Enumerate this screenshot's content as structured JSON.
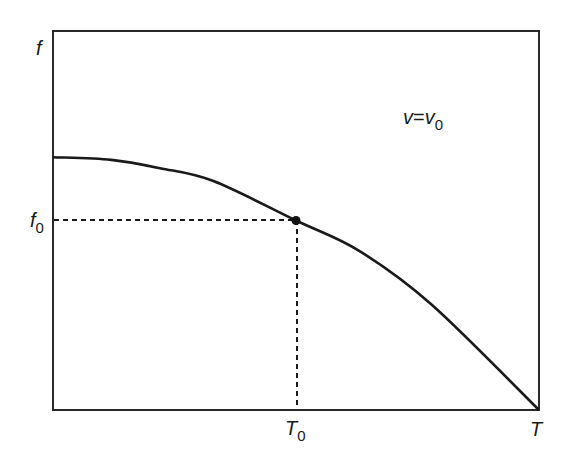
{
  "chart_data": {
    "type": "line",
    "title": "",
    "xlabel": "T",
    "ylabel": "f",
    "annotation": {
      "lhs": "v",
      "rhs": "v",
      "rhs_sub": "0",
      "text": "v=v0"
    },
    "x_marker": {
      "label": "T",
      "sub": "0",
      "value": 0.5
    },
    "y_marker": {
      "label": "f",
      "sub": "0",
      "value": 0.5
    },
    "x_axis_end_label": "T",
    "xlim": [
      0,
      1
    ],
    "ylim": [
      0,
      1
    ],
    "grid": false,
    "legend": "none",
    "series": [
      {
        "name": "f(T) at v=v0",
        "x": [
          0.0,
          0.12,
          0.22,
          0.33,
          0.5,
          0.63,
          0.78,
          1.0
        ],
        "y": [
          0.667,
          0.66,
          0.638,
          0.604,
          0.5,
          0.42,
          0.277,
          0.0
        ]
      }
    ],
    "highlight_point": {
      "x": 0.5,
      "y": 0.5,
      "label": "(T0, f0)"
    }
  },
  "labels": {
    "y_axis": "f",
    "f0_main": "f",
    "f0_sub": "0",
    "t0_main": "T",
    "t0_sub": "0",
    "x_axis_end": "T",
    "annotation_v": "v",
    "annotation_eq": "=",
    "annotation_v0_main": "v",
    "annotation_v0_sub": "0"
  },
  "colors": {
    "line": "#1a1a1a",
    "frame": "#2a2a2a",
    "background": "#ffffff"
  }
}
